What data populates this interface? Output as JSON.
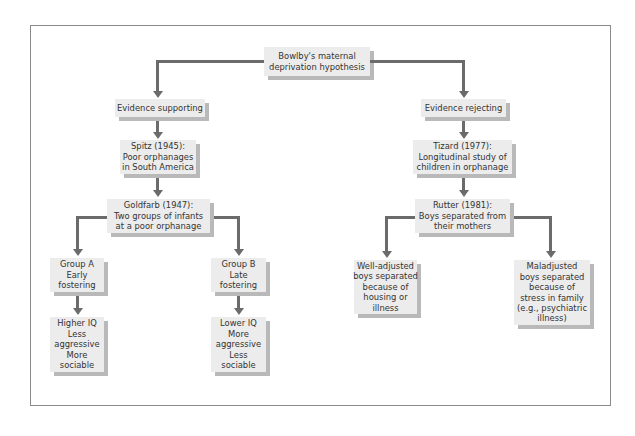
{
  "diagram": {
    "root": {
      "lines": [
        "Bowlby's maternal",
        "deprivation hypothesis"
      ]
    },
    "supporting": {
      "heading": {
        "lines": [
          "Evidence supporting"
        ]
      },
      "spitz": {
        "lines": [
          "Spitz (1945):",
          "Poor orphanages",
          "in South America"
        ]
      },
      "goldfarb": {
        "lines": [
          "Goldfarb (1947):",
          "Two groups of infants",
          "at a poor orphanage"
        ]
      },
      "group_a": {
        "lines": [
          "Group A",
          "Early",
          "fostering"
        ]
      },
      "group_a_outcome": {
        "lines": [
          "Higher IQ",
          "Less",
          "aggressive",
          "More",
          "sociable"
        ]
      },
      "group_b": {
        "lines": [
          "Group B",
          "Late",
          "fostering"
        ]
      },
      "group_b_outcome": {
        "lines": [
          "Lower IQ",
          "More",
          "aggressive",
          "Less",
          "sociable"
        ]
      }
    },
    "rejecting": {
      "heading": {
        "lines": [
          "Evidence rejecting"
        ]
      },
      "tizard": {
        "lines": [
          "Tizard (1977):",
          "Longitudinal study of",
          "children in orphanage"
        ]
      },
      "rutter": {
        "lines": [
          "Rutter (1981):",
          "Boys separated from",
          "their mothers"
        ]
      },
      "well_adjusted": {
        "lines": [
          "Well-adjusted",
          "boys separated",
          "because of",
          "housing or",
          "illness"
        ]
      },
      "maladjusted": {
        "lines": [
          "Maladjusted",
          "boys separated",
          "because of",
          "stress in family",
          "(e.g., psychiatric",
          "illness)"
        ]
      }
    },
    "colors": {
      "box_fill": "#ececec",
      "box_shadow": "#b9b9b9",
      "connector": "#6b6b6b",
      "frame_border": "#8a8a8a",
      "text": "#333333"
    }
  }
}
